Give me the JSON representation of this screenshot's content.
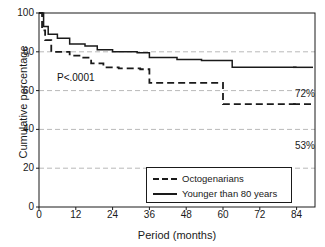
{
  "chart_data": {
    "type": "line",
    "title": "",
    "xlabel": "Period (months)",
    "ylabel": "Cumulative percentage",
    "xlim": [
      0,
      90
    ],
    "ylim": [
      0,
      100
    ],
    "xticks": [
      0,
      12,
      24,
      36,
      48,
      60,
      72,
      84
    ],
    "yticks": [
      0,
      20,
      40,
      60,
      80,
      100
    ],
    "xticklabels": [
      "0",
      "12",
      "24",
      "36",
      "48",
      "60",
      "72",
      "84"
    ],
    "yticklabels": [
      "0",
      "20",
      "40",
      "60",
      "80",
      "100"
    ],
    "grid": "horizontal dashed gridlines at 20, 40, 60, 80",
    "gridlines": [
      20,
      40,
      60,
      80
    ],
    "legend_position": "bottom-right inside axes",
    "annotations": [
      {
        "text": "P<.0001",
        "x": 6,
        "y": 61
      },
      {
        "text": "72%",
        "x": 88,
        "y": 72
      },
      {
        "text": "53%",
        "x": 88,
        "y": 53
      }
    ],
    "series": [
      {
        "name": "Younger than 80 years",
        "style": "solid",
        "color": "#1a1a1a",
        "end_value": 72,
        "end_label": "72%",
        "points": [
          [
            0,
            100
          ],
          [
            1.5,
            100
          ],
          [
            1.5,
            93
          ],
          [
            3,
            93
          ],
          [
            3,
            89
          ],
          [
            6,
            89
          ],
          [
            6,
            87
          ],
          [
            10,
            87
          ],
          [
            10,
            84
          ],
          [
            15,
            84
          ],
          [
            15,
            83
          ],
          [
            19,
            83
          ],
          [
            19,
            81
          ],
          [
            24,
            81
          ],
          [
            24,
            80
          ],
          [
            32,
            80
          ],
          [
            32,
            79.5
          ],
          [
            36,
            79.5
          ],
          [
            36,
            77
          ],
          [
            45,
            77
          ],
          [
            45,
            76
          ],
          [
            53,
            76
          ],
          [
            53,
            75.5
          ],
          [
            63,
            75.5
          ],
          [
            63,
            72
          ],
          [
            72,
            72
          ],
          [
            84,
            72
          ]
        ]
      },
      {
        "name": "Octogenarians",
        "style": "dashed",
        "color": "#1a1a1a",
        "end_value": 53,
        "end_label": "53%",
        "points": [
          [
            0,
            100
          ],
          [
            1,
            100
          ],
          [
            1,
            91
          ],
          [
            2,
            91
          ],
          [
            2,
            86
          ],
          [
            4,
            86
          ],
          [
            4,
            80
          ],
          [
            10,
            80
          ],
          [
            10,
            78
          ],
          [
            14,
            78
          ],
          [
            14,
            77
          ],
          [
            17,
            77
          ],
          [
            17,
            74
          ],
          [
            21,
            74
          ],
          [
            21,
            72
          ],
          [
            26,
            72
          ],
          [
            26,
            71.5
          ],
          [
            33,
            71.5
          ],
          [
            33,
            71
          ],
          [
            36,
            71
          ],
          [
            36,
            64
          ],
          [
            48,
            64
          ],
          [
            60,
            64
          ],
          [
            60,
            53
          ],
          [
            72,
            53
          ],
          [
            84,
            53
          ]
        ]
      }
    ]
  },
  "legend": {
    "items": [
      {
        "label": "Octogenarians",
        "style": "dashed"
      },
      {
        "label": "Younger than 80 years",
        "style": "solid"
      }
    ]
  },
  "axes": {
    "ylabel": "Cumulative percentage",
    "xlabel": "Period (months)",
    "yticklabels": [
      "100",
      "80",
      "60",
      "40",
      "20",
      "0"
    ],
    "xticklabels": [
      "0",
      "12",
      "24",
      "36",
      "48",
      "60",
      "72",
      "84"
    ]
  },
  "annotations": {
    "pvalue": "P<.0001",
    "end_solid": "72%",
    "end_dashed": "53%"
  },
  "colors": {
    "line": "#1a1a1a",
    "grid": "#b9b9b9",
    "frame": "#1a1a1a",
    "background": "#ffffff"
  }
}
